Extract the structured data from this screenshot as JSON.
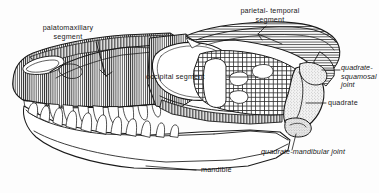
{
  "figure": {
    "type": "anatomical-diagram",
    "background_color": "#fdfdfd",
    "ink_color": "#1a1a1a"
  },
  "labels": {
    "palatomaxillary_segment": {
      "line1": "palatomaxillary",
      "line2": "segment"
    },
    "parietal_temporal_segment": {
      "line1": "parietal- temporal",
      "line2": "segment"
    },
    "occipital_segment": "occipital  segment",
    "quadrate_squamosal_joint": {
      "line1": "quadrate-",
      "line2": "squamosal",
      "line3": "joint"
    },
    "quadrate": "quadrate",
    "quadrate_mandibular_joint": "quadrate-mandibular joint",
    "mandible": "mandible"
  },
  "regions": [
    {
      "name": "palatomaxillary-segment",
      "fill_pattern": "vertical-hatch",
      "label_ref": "palatomaxillary_segment"
    },
    {
      "name": "parietal-temporal-segment",
      "fill_pattern": "horizontal-hatch",
      "label_ref": "parietal_temporal_segment"
    },
    {
      "name": "occipital-segment",
      "fill_pattern": "cross-hatch",
      "label_ref": "occipital_segment"
    },
    {
      "name": "quadrate",
      "fill_pattern": "stipple",
      "label_ref": "quadrate"
    },
    {
      "name": "mandible",
      "fill_pattern": "none",
      "label_ref": "mandible"
    }
  ],
  "joints": [
    {
      "name": "quadrate-squamosal-joint",
      "label_ref": "quadrate_squamosal_joint"
    },
    {
      "name": "quadrate-mandibular-joint",
      "label_ref": "quadrate_mandibular_joint"
    }
  ]
}
